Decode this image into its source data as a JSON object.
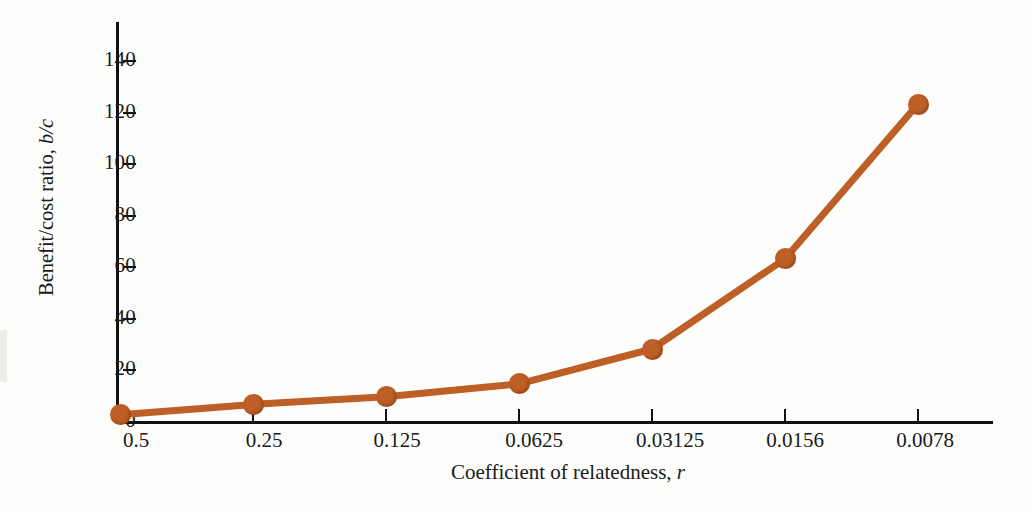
{
  "figure": {
    "background_color": "#fdfdfb",
    "axis_color": "#111111",
    "series_color": "#bd5f26",
    "marker_color": "#bd5f26"
  },
  "chart_data": {
    "type": "line",
    "title": "",
    "xlabel_text": "Coefficient of relatedness, ",
    "xlabel_symbol": "r",
    "ylabel_text": "Benefit/cost ratio, ",
    "ylabel_symbol": "b/c",
    "categories": [
      "0.5",
      "0.25",
      "0.125",
      "0.0625",
      "0.03125",
      "0.0156",
      "0.0078"
    ],
    "x_numeric": [
      0.5,
      0.25,
      0.125,
      0.0625,
      0.03125,
      0.0156,
      0.0078
    ],
    "values": [
      3,
      7,
      10,
      15,
      28.5,
      63.5,
      123.5
    ],
    "series": [
      {
        "name": "Benefit/cost ratio",
        "values": [
          3,
          7,
          10,
          15,
          28.5,
          63.5,
          123.5
        ]
      }
    ],
    "ylim": [
      0,
      148
    ],
    "yticks": [
      0,
      20,
      40,
      60,
      80,
      100,
      120,
      140
    ],
    "ytick_labels": [
      "0",
      "20",
      "40",
      "60",
      "80",
      "100",
      "120",
      "140"
    ],
    "grid": false,
    "legend": null,
    "legend_position": "none",
    "marker": "circle",
    "annotations": []
  }
}
